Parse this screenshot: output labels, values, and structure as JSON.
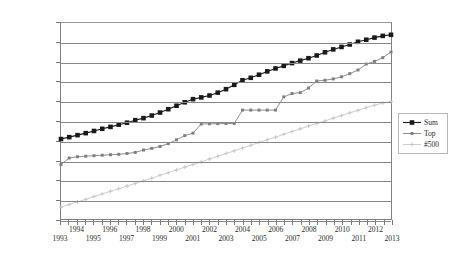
{
  "chart_data": {
    "type": "line",
    "title": "",
    "xlabel": "",
    "ylabel": "",
    "scale": "log",
    "grid": true,
    "legend_position": "right",
    "ylim": [
      0.1,
      1000000000
    ],
    "xlim": [
      1993,
      2013
    ],
    "y_tick_labels": [
      "1000 000 000",
      "100 000 000",
      "10 000 000",
      "1000 000",
      "100 000",
      "10 000",
      "1000",
      "100",
      "10",
      "1",
      "0.1"
    ],
    "y_tick_values": [
      1000000000,
      100000000,
      10000000,
      1000000,
      100000,
      10000,
      1000,
      100,
      10,
      1,
      0.1
    ],
    "x_tick_labels": [
      "1993",
      "1994",
      "1995",
      "1996",
      "1997",
      "1998",
      "1999",
      "2000",
      "2001",
      "2002",
      "2003",
      "2004",
      "2005",
      "2006",
      "2007",
      "2008",
      "2009",
      "2010",
      "2011",
      "2012",
      "2013"
    ],
    "x": [
      1993,
      1993.5,
      1994,
      1994.5,
      1995,
      1995.5,
      1996,
      1996.5,
      1997,
      1997.5,
      1998,
      1998.5,
      1999,
      1999.5,
      2000,
      2000.5,
      2001,
      2001.5,
      2002,
      2002.5,
      2003,
      2003.5,
      2004,
      2004.5,
      2005,
      2005.5,
      2006,
      2006.5,
      2007,
      2007.5,
      2008,
      2008.5,
      2009,
      2009.5,
      2010,
      2010.5,
      2011,
      2011.5,
      2012,
      2012.5,
      2013
    ],
    "series": [
      {
        "name": "Sum",
        "color": "#1a1a1a",
        "marker": "square",
        "values": [
          1200,
          1500,
          1900,
          2400,
          3100,
          4000,
          5000,
          6500,
          8200,
          11000,
          14000,
          19000,
          27000,
          40000,
          60000,
          90000,
          130000,
          160000,
          200000,
          280000,
          420000,
          700000,
          1200000,
          1600000,
          2300000,
          3400000,
          4800000,
          6500000,
          9000000,
          12000000,
          16000000,
          22000000,
          32000000,
          45000000,
          60000000,
          80000000,
          110000000,
          140000000,
          180000000,
          220000000,
          250000000
        ]
      },
      {
        "name": "Top",
        "color": "#808080",
        "marker": "diamond",
        "values": [
          60,
          130,
          150,
          160,
          170,
          180,
          190,
          200,
          220,
          250,
          330,
          400,
          500,
          700,
          1100,
          1800,
          2400,
          7000,
          7200,
          7300,
          7400,
          7500,
          36000,
          36000,
          36000,
          36000,
          36000,
          170000,
          250000,
          280000,
          480000,
          1100000,
          1200000,
          1400000,
          1800000,
          2600000,
          4000000,
          8000000,
          11000000,
          17000000,
          33000000
        ]
      },
      {
        "name": "#500",
        "color": "#c8c8c8",
        "marker": "cross",
        "values": [
          0.4,
          0.55,
          0.75,
          1.0,
          1.4,
          1.9,
          2.6,
          3.5,
          4.8,
          6.5,
          9,
          12,
          17,
          23,
          32,
          44,
          60,
          82,
          115,
          160,
          220,
          300,
          420,
          580,
          800,
          1100,
          1500,
          2100,
          2900,
          4000,
          5500,
          7500,
          10000,
          14000,
          19000,
          26000,
          35000,
          48000,
          64000,
          82000,
          100000
        ]
      }
    ]
  }
}
